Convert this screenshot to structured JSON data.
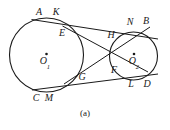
{
  "figure": {
    "caption": "(a)",
    "stroke_color": "#1a1a1a",
    "background_color": "#ffffff",
    "width": 170,
    "height": 130
  },
  "circles": [
    {
      "name": "left-circle",
      "center_label": "O",
      "center_subscript": "1",
      "cx": 46.5,
      "cy": 55,
      "r": 37
    },
    {
      "name": "right-circle",
      "center_label": "O",
      "center_subscript": "2",
      "cx": 133.5,
      "cy": 56,
      "r": 24
    }
  ],
  "center_labels": [
    {
      "id": "O1",
      "letter": "O",
      "sub": "1",
      "x": 45,
      "y": 62,
      "dot_x": 46.5,
      "dot_y": 55
    },
    {
      "id": "O2",
      "letter": "O",
      "sub": "2",
      "x": 134,
      "y": 62,
      "dot_x": 134,
      "dot_y": 55
    }
  ],
  "point_labels": [
    {
      "id": "A",
      "text": "A",
      "x": 39,
      "y": 12
    },
    {
      "id": "K",
      "text": "K",
      "x": 56,
      "y": 12
    },
    {
      "id": "N",
      "text": "N",
      "x": 130,
      "y": 22
    },
    {
      "id": "B",
      "text": "B",
      "x": 146,
      "y": 21
    },
    {
      "id": "E",
      "text": "E",
      "x": 62,
      "y": 33
    },
    {
      "id": "H",
      "text": "H",
      "x": 111,
      "y": 35
    },
    {
      "id": "F",
      "text": "F",
      "x": 114,
      "y": 70
    },
    {
      "id": "G",
      "text": "G",
      "x": 82,
      "y": 77
    },
    {
      "id": "C",
      "text": "C",
      "x": 36,
      "y": 98
    },
    {
      "id": "M",
      "text": "M",
      "x": 49,
      "y": 98
    },
    {
      "id": "L",
      "text": "L",
      "x": 131,
      "y": 84
    },
    {
      "id": "D",
      "text": "D",
      "x": 147,
      "y": 84
    }
  ],
  "tangent_lines": [
    {
      "id": "upper-external-tangent",
      "from": "K",
      "to": "N",
      "x1": 53,
      "y1": 20,
      "x2": 170,
      "y2": 35
    },
    {
      "id": "lower-external-tangent",
      "from": "M",
      "to": "L",
      "x1": 44,
      "y1": 92,
      "x2": 170,
      "y2": 78
    },
    {
      "id": "internal-tangent-E-F",
      "from": "E",
      "to": "F",
      "x1": 66,
      "y1": 40,
      "x2": 145,
      "y2": 75
    },
    {
      "id": "internal-tangent-G-H",
      "from": "G",
      "to": "H",
      "x1": 72,
      "y1": 84,
      "x2": 150,
      "y2": 30
    }
  ]
}
